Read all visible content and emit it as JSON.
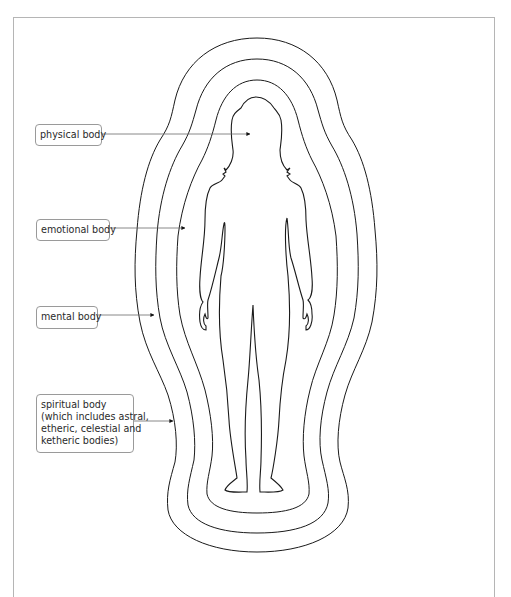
{
  "diagram": {
    "type": "aura-layers-figure",
    "stroke_color": "#1a1a1a",
    "frame_color": "#b5b5b5",
    "labels": [
      {
        "id": "physical",
        "text": "physical body",
        "points_to": "figure interior"
      },
      {
        "id": "emotional",
        "text": "emotional body",
        "points_to": "inner aura contour"
      },
      {
        "id": "mental",
        "text": "mental body",
        "points_to": "middle aura contour"
      },
      {
        "id": "spiritual",
        "lines": [
          "spiritual body",
          "(which includes astral,",
          "etheric, celestial and",
          "ketheric bodies)"
        ],
        "points_to": "outer aura contour"
      }
    ]
  }
}
